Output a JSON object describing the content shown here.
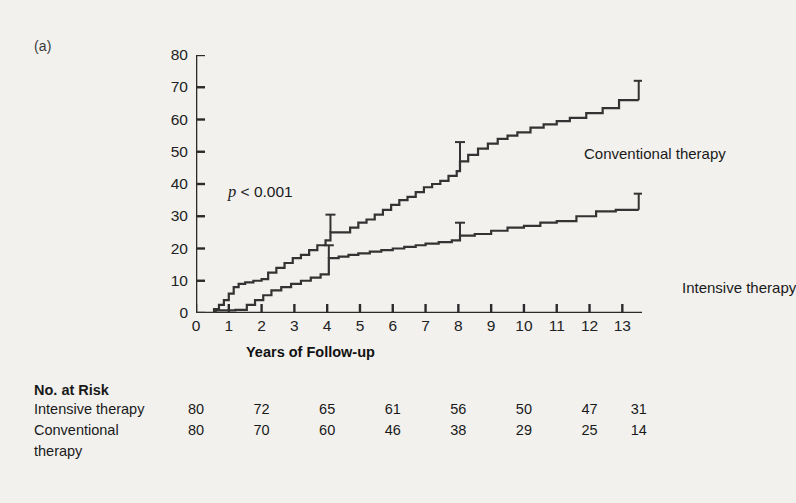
{
  "figure": {
    "panel_label": "(a)",
    "pvalue_italic": "p",
    "pvalue_text": " < 0.001"
  },
  "chart_data": {
    "type": "line",
    "title": "",
    "xlabel": "Years of Follow-up",
    "ylabel": "Cumulative Incidence of Any Cardiovascular Event (%)",
    "ylabel_line1": "Cumulative Incidence of Any",
    "ylabel_line2": "Cardiovascular Event (%)",
    "xlim": [
      0,
      13.6
    ],
    "ylim": [
      0,
      80
    ],
    "xticks": [
      0,
      1,
      2,
      3,
      4,
      5,
      6,
      7,
      8,
      9,
      10,
      11,
      12,
      13
    ],
    "yticks": [
      0,
      10,
      20,
      30,
      40,
      50,
      60,
      70,
      80
    ],
    "grid": false,
    "legend_position": "inline-annotation",
    "annotation": "p < 0.001",
    "series": [
      {
        "name": "Conventional therapy",
        "style": "step",
        "color": "#333333",
        "x": [
          0,
          0.55,
          0.7,
          0.85,
          1.0,
          1.15,
          1.3,
          1.5,
          1.75,
          2.0,
          2.2,
          2.45,
          2.7,
          2.95,
          3.2,
          3.45,
          3.7,
          3.95,
          4.1,
          4.45,
          4.7,
          4.95,
          5.2,
          5.45,
          5.7,
          5.95,
          6.2,
          6.45,
          6.7,
          6.95,
          7.2,
          7.45,
          7.7,
          7.95,
          8.05,
          8.3,
          8.6,
          8.9,
          9.2,
          9.5,
          9.8,
          10.2,
          10.6,
          11.0,
          11.4,
          11.9,
          12.4,
          12.9,
          13.5
        ],
        "y": [
          0,
          1.2,
          2.5,
          4.0,
          6.0,
          8.0,
          9.0,
          9.5,
          10.0,
          10.5,
          12.5,
          14.0,
          15.5,
          17.0,
          18.0,
          19.5,
          21.0,
          22.5,
          25.0,
          25.0,
          26.5,
          28.0,
          29.0,
          30.5,
          32.0,
          33.5,
          35.0,
          36.0,
          37.5,
          39.0,
          40.0,
          41.0,
          42.5,
          44.0,
          47.0,
          49.0,
          51.0,
          52.5,
          54.0,
          55.0,
          56.0,
          57.5,
          58.5,
          59.5,
          60.5,
          62.0,
          63.5,
          66.0,
          66.0
        ],
        "error_bars": [
          {
            "x": 4.1,
            "y": 25.0,
            "upper": 30.5
          },
          {
            "x": 8.05,
            "y": 47.0,
            "upper": 53.0
          },
          {
            "x": 13.5,
            "y": 66.0,
            "upper": 72.0
          }
        ],
        "final_value": 66.0
      },
      {
        "name": "Intensive therapy",
        "style": "step",
        "color": "#333333",
        "x": [
          0,
          0.6,
          1.2,
          1.55,
          1.8,
          2.05,
          2.3,
          2.6,
          2.9,
          3.2,
          3.5,
          3.8,
          4.05,
          4.35,
          4.65,
          4.95,
          5.3,
          5.65,
          6.0,
          6.35,
          6.7,
          7.0,
          7.4,
          7.8,
          8.05,
          8.5,
          9.0,
          9.5,
          10.0,
          10.5,
          11.0,
          11.6,
          12.2,
          12.8,
          13.5
        ],
        "y": [
          0,
          0.8,
          1.0,
          2.5,
          4.0,
          5.5,
          7.0,
          8.0,
          9.0,
          10.0,
          11.0,
          12.0,
          17.0,
          17.5,
          18.0,
          18.5,
          19.0,
          19.5,
          20.0,
          20.5,
          21.0,
          21.5,
          22.0,
          22.5,
          24.0,
          24.5,
          25.5,
          26.5,
          27.0,
          28.0,
          28.5,
          30.0,
          31.5,
          32.0,
          32.0
        ],
        "error_bars": [
          {
            "x": 4.05,
            "y": 17.0,
            "upper": 21.0
          },
          {
            "x": 8.05,
            "y": 24.0,
            "upper": 28.0
          },
          {
            "x": 13.5,
            "y": 32.0,
            "upper": 37.0
          }
        ],
        "final_value": 32.0
      }
    ]
  },
  "risk_table": {
    "title": "No. at Risk",
    "x_positions": [
      0,
      2,
      4,
      6,
      8,
      10,
      12,
      13.5
    ],
    "rows": [
      {
        "label": "Intensive therapy",
        "label_cont": "",
        "values": [
          80,
          72,
          65,
          61,
          56,
          50,
          47,
          31
        ]
      },
      {
        "label": "Conventional",
        "label_cont": "therapy",
        "values": [
          80,
          70,
          60,
          46,
          38,
          29,
          25,
          14
        ]
      }
    ]
  }
}
